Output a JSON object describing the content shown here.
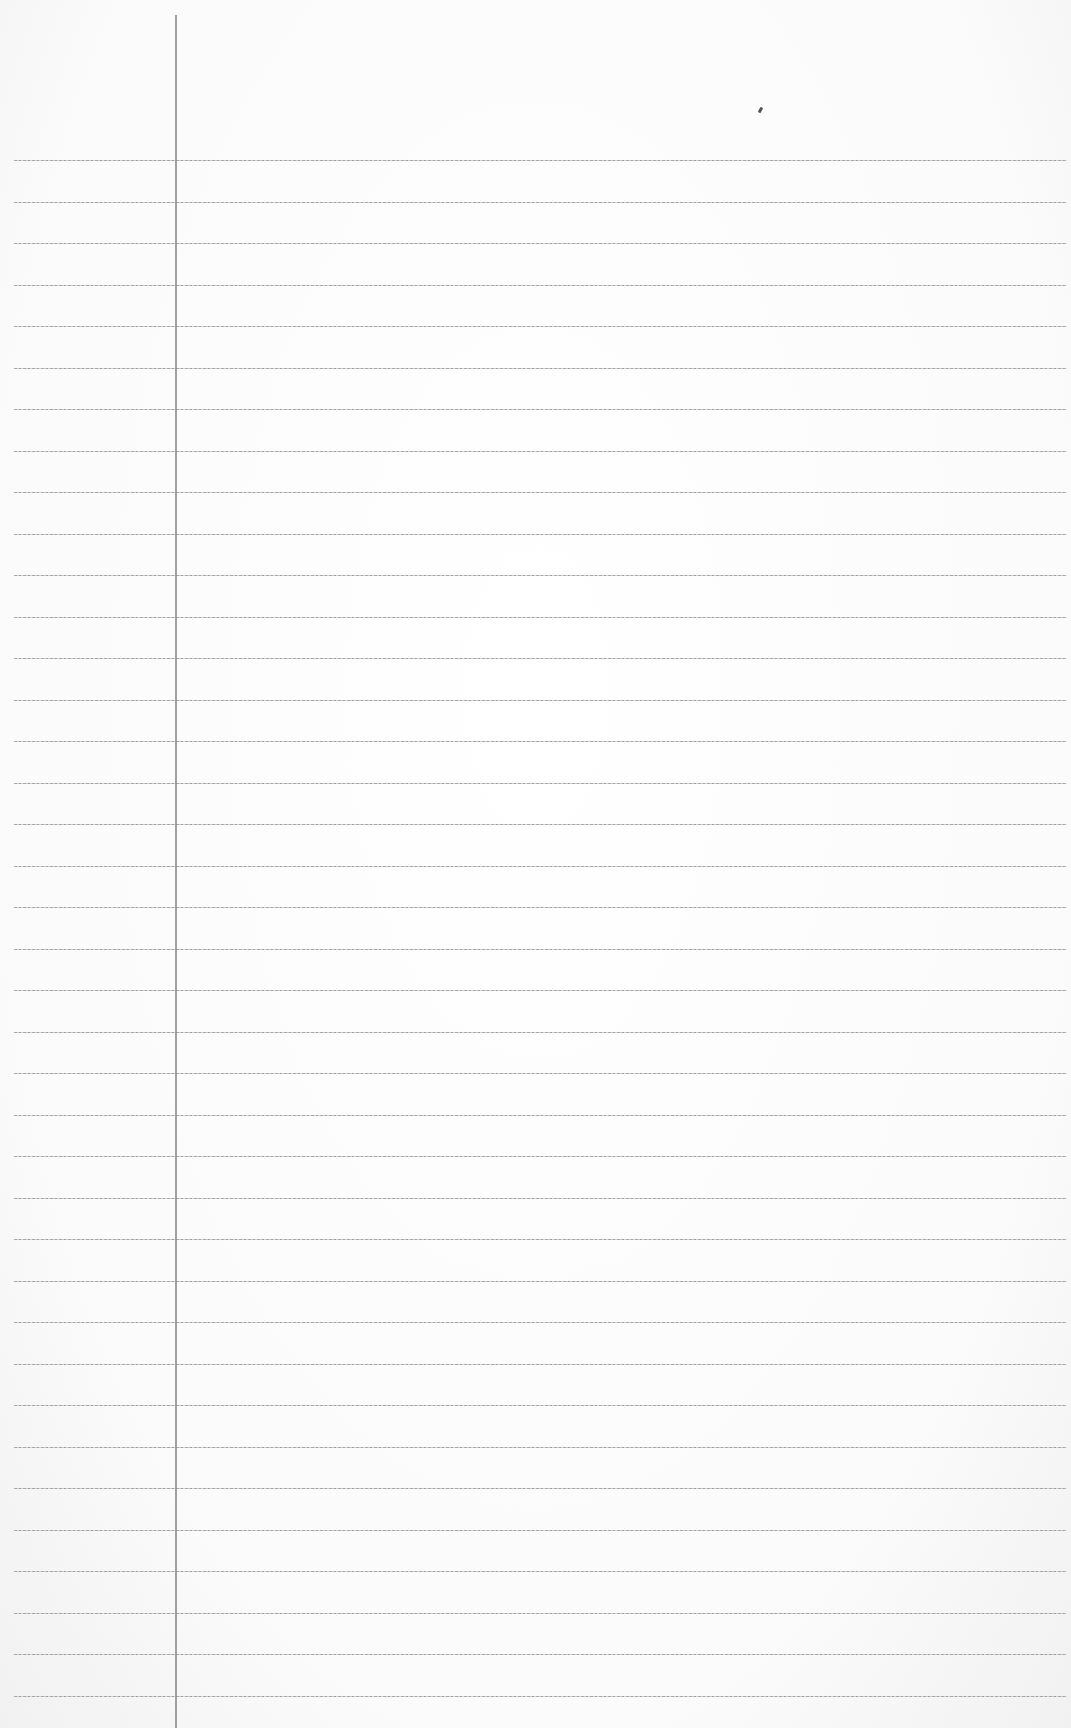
{
  "page": {
    "type": "lined-notebook-paper",
    "background_color": "#fbfbfb",
    "rule_color": "#9a9a9a",
    "margin_line_color": "#8a8a8a",
    "margin_line_x": 175,
    "first_rule_y": 160,
    "rule_spacing": 41.5,
    "rule_count": 38,
    "text_content": ""
  }
}
